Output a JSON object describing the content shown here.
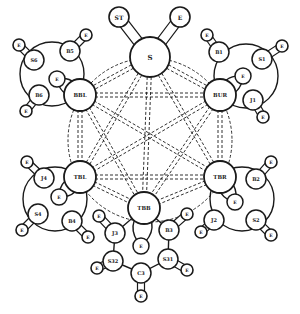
{
  "diagram": {
    "type": "network-topology",
    "core": {
      "id": "S",
      "label": "S",
      "x": 150,
      "y": 57,
      "r": 20,
      "attached": [
        {
          "label": "ST",
          "x": 119,
          "y": 17,
          "r": 10
        },
        {
          "label": "E",
          "x": 180,
          "y": 17,
          "r": 10
        }
      ]
    },
    "hubs": [
      {
        "id": "BBL",
        "label": "BBL",
        "x": 80,
        "y": 95,
        "r": 16
      },
      {
        "id": "BUR",
        "label": "BUR",
        "x": 220,
        "y": 95,
        "r": 16
      },
      {
        "id": "TBL",
        "label": "TBL",
        "x": 80,
        "y": 177,
        "r": 16
      },
      {
        "id": "TBR",
        "label": "TBR",
        "x": 220,
        "y": 177,
        "r": 16
      },
      {
        "id": "TBB",
        "label": "TBB",
        "x": 144,
        "y": 208,
        "r": 16
      }
    ],
    "clusters": [
      {
        "hub": "BBL",
        "ring": {
          "x": 52,
          "y": 74,
          "r": 32
        },
        "nodes": [
          {
            "label": "S6",
            "x": 34,
            "y": 60,
            "r": 10,
            "end": {
              "label": "E",
              "x": 19,
              "y": 45
            }
          },
          {
            "label": "B5",
            "x": 70,
            "y": 51,
            "r": 10,
            "end": {
              "label": "E",
              "x": 86,
              "y": 35
            }
          },
          {
            "label": "B6",
            "x": 39,
            "y": 95,
            "r": 10,
            "end": {
              "label": "E",
              "x": 26,
              "y": 111
            }
          }
        ],
        "local": {
          "label": "E",
          "x": 57,
          "y": 79,
          "r": 8
        }
      },
      {
        "hub": "BUR",
        "ring": {
          "x": 246,
          "y": 76,
          "r": 32
        },
        "nodes": [
          {
            "label": "B1",
            "x": 219,
            "y": 52,
            "r": 10,
            "end": {
              "label": "E",
              "x": 207,
              "y": 35
            }
          },
          {
            "label": "S1",
            "x": 262,
            "y": 59,
            "r": 10,
            "end": {
              "label": "E",
              "x": 282,
              "y": 46
            }
          },
          {
            "label": "J1",
            "x": 253,
            "y": 100,
            "r": 10,
            "end": {
              "label": "E",
              "x": 263,
              "y": 117
            }
          }
        ],
        "local": {
          "label": "E",
          "x": 243,
          "y": 76,
          "r": 8
        }
      },
      {
        "hub": "TBL",
        "ring": {
          "x": 55,
          "y": 199,
          "r": 32
        },
        "nodes": [
          {
            "label": "J4",
            "x": 44,
            "y": 178,
            "r": 10,
            "end": {
              "label": "E",
              "x": 27,
              "y": 162
            }
          },
          {
            "label": "S4",
            "x": 38,
            "y": 214,
            "r": 10,
            "end": {
              "label": "E",
              "x": 22,
              "y": 230
            }
          },
          {
            "label": "B4",
            "x": 72,
            "y": 221,
            "r": 10,
            "end": {
              "label": "E",
              "x": 88,
              "y": 237
            }
          }
        ],
        "local": {
          "label": "E",
          "x": 59,
          "y": 197,
          "r": 8
        }
      },
      {
        "hub": "TBR",
        "ring": {
          "x": 242,
          "y": 199,
          "r": 32
        },
        "nodes": [
          {
            "label": "B2",
            "x": 256,
            "y": 179,
            "r": 10,
            "end": {
              "label": "E",
              "x": 271,
              "y": 162
            }
          },
          {
            "label": "J2",
            "x": 214,
            "y": 220,
            "r": 10,
            "end": {
              "label": "E",
              "x": 201,
              "y": 232
            }
          },
          {
            "label": "S2",
            "x": 256,
            "y": 220,
            "r": 10,
            "end": {
              "label": "E",
              "x": 271,
              "y": 235
            }
          }
        ],
        "local": {
          "label": "E",
          "x": 235,
          "y": 202,
          "r": 8
        }
      },
      {
        "hub": "TBB",
        "ring": null,
        "nodes": [
          {
            "label": "J3",
            "x": 115,
            "y": 233,
            "r": 10,
            "end": {
              "label": "E",
              "x": 99,
              "y": 216
            }
          },
          {
            "label": "B3",
            "x": 169,
            "y": 230,
            "r": 10,
            "end": {
              "label": "E",
              "x": 187,
              "y": 214
            }
          },
          {
            "label": "S32",
            "x": 113,
            "y": 261,
            "r": 10,
            "end": {
              "label": "E",
              "x": 97,
              "y": 268
            }
          },
          {
            "label": "S31",
            "x": 168,
            "y": 259,
            "r": 10,
            "end": {
              "label": "E",
              "x": 187,
              "y": 270
            }
          },
          {
            "label": "C3",
            "x": 141,
            "y": 273,
            "r": 10,
            "end": {
              "label": "E",
              "x": 141,
              "y": 296
            }
          }
        ],
        "local": {
          "label": "E",
          "x": 141,
          "y": 246,
          "r": 8
        }
      }
    ],
    "mesh": {
      "style": "dashed",
      "members": [
        "S",
        "BBL",
        "BUR",
        "TBL",
        "TBR",
        "TBB"
      ],
      "outer_ellipse": {
        "x": 150,
        "y": 140,
        "rx": 82,
        "ry": 82
      }
    },
    "colors": {
      "stroke": "#1a1a1a",
      "fill": "#ffffff",
      "background": "#ffffff"
    }
  }
}
